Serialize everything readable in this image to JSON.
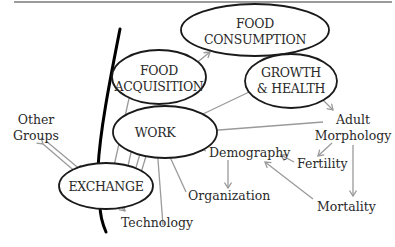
{
  "diagram": {
    "nodes": {
      "food_consumption": {
        "line1": "FOOD",
        "line2": "CONSUMPTION"
      },
      "food_acquisition": {
        "line1": "FOOD",
        "line2": "ACQUISITION"
      },
      "growth_health": {
        "line1": "GROWTH",
        "line2": "& HEALTH"
      },
      "work": {
        "label": "WORK"
      },
      "exchange": {
        "label": "EXCHANGE"
      }
    },
    "labels": {
      "other_groups": {
        "line1": "Other",
        "line2": "Groups"
      },
      "adult_morphology": {
        "line1": "Adult",
        "line2": "Morphology"
      },
      "demography": "Demography",
      "fertility": "Fertility",
      "organization": "Organization",
      "mortality": "Mortality",
      "technology": "Technology"
    },
    "colors": {
      "ellipse_stroke": "#1a1a1a",
      "arrow": "#9a9a9a",
      "boundary": "#000000",
      "text": "#2a2a2a"
    }
  }
}
